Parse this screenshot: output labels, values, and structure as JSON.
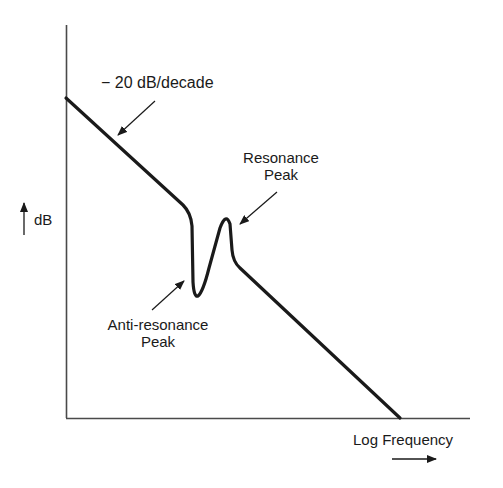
{
  "diagram": {
    "type": "frequency-response-sketch",
    "axes": {
      "y_label": "dB",
      "x_label": "Log Frequency"
    },
    "annotations": {
      "slope": "− 20 dB/decade",
      "resonance_line1": "Resonance",
      "resonance_line2": "Peak",
      "antiresonance_line1": "Anti-resonance",
      "antiresonance_line2": "Peak"
    },
    "colors": {
      "line": "#1a1a1a",
      "axis": "#4a4a4a",
      "background": "#ffffff"
    }
  }
}
